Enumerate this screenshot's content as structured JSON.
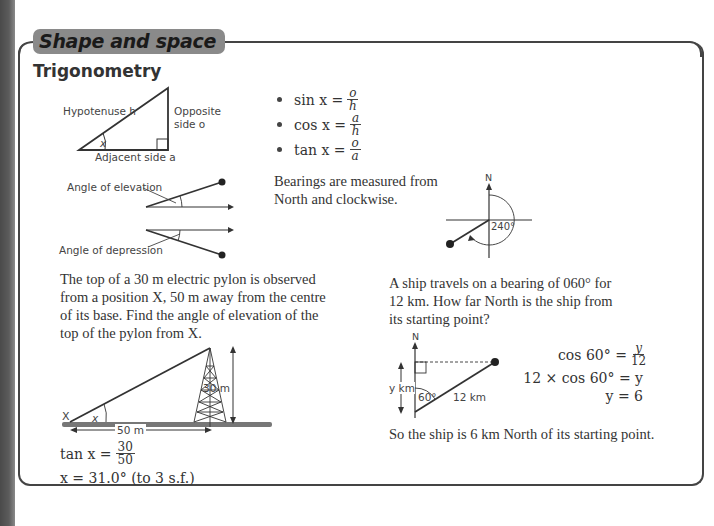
{
  "header": {
    "chapter_tab": "Shape and space",
    "section_title": "Trigonometry"
  },
  "triangle_diagram": {
    "hypotenuse_label": "Hypotenuse h",
    "opposite_label_line1": "Opposite",
    "opposite_label_line2": "side o",
    "adjacent_label": "Adjacent side a",
    "angle_label": "x"
  },
  "angles_diagram": {
    "elevation_label": "Angle of elevation",
    "depression_label": "Angle of depression"
  },
  "ratios": [
    {
      "func": "sin x =",
      "num": "o",
      "den": "h"
    },
    {
      "func": "cos x =",
      "num": "a",
      "den": "h"
    },
    {
      "func": "tan x =",
      "num": "o",
      "den": "a"
    }
  ],
  "bearings": {
    "text_line1": "Bearings are measured from",
    "text_line2": "North and clockwise.",
    "north_label": "N",
    "angle_label": "240°"
  },
  "pylon_example": {
    "question_line1": "The top of a 30 m electric pylon is observed",
    "question_line2": "from a position X, 50 m away from the centre",
    "question_line3": "of its base. Find the angle of elevation of the",
    "question_line4": "top of the pylon from X.",
    "point_label": "X",
    "angle_label": "x",
    "height_label": "30 m",
    "distance_label": "50 m",
    "solution_line1_lhs": "tan x =",
    "solution_line1_num": "30",
    "solution_line1_den": "50",
    "solution_line2": "x = 31.0° (to 3 s.f.)"
  },
  "ship_example": {
    "question_line1": "A ship travels on a bearing of 060° for",
    "question_line2": "12 km. How far North is the ship from",
    "question_line3": "its starting point?",
    "north_label": "N",
    "y_label": "y km",
    "angle_label": "60°",
    "distance_label": "12 km",
    "step1_lhs": "cos 60° =",
    "step1_num": "y",
    "step1_den": "12",
    "step2": "12 × cos 60° = y",
    "step3": "y = 6",
    "conclusion": "So the ship is 6 km North of its starting point."
  }
}
